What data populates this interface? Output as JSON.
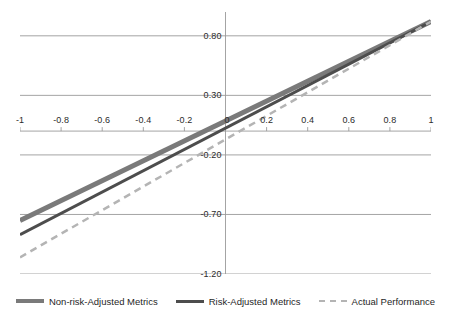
{
  "chart_data": {
    "type": "line",
    "title": "",
    "subtitle": "",
    "xlabel": "",
    "ylabel": "",
    "xlim": [
      -1,
      1
    ],
    "ylim": [
      -1.2,
      1.0
    ],
    "grid": true,
    "legend_position": "bottom",
    "x_ticks": [
      "-1",
      "-0.8",
      "-0.6",
      "-0.4",
      "-0.2",
      "0",
      "0.2",
      "0.4",
      "0.6",
      "0.8",
      "1"
    ],
    "x_tick_values": [
      -1,
      -0.8,
      -0.6,
      -0.4,
      -0.2,
      0,
      0.2,
      0.4,
      0.6,
      0.8,
      1
    ],
    "y_ticks": [
      "0.80",
      "0.30",
      "-0.20",
      "-0.70",
      "-1.20"
    ],
    "y_tick_values": [
      0.8,
      0.3,
      -0.2,
      -0.7,
      -1.2
    ],
    "x": [
      -1,
      1
    ],
    "series": [
      {
        "name": "Non-risk-Adjusted Metrics",
        "color": "#7a7a7a",
        "style": "solid",
        "width": 5,
        "values": [
          -0.75,
          0.92
        ]
      },
      {
        "name": "Risk-Adjusted Metrics",
        "color": "#4d4d4d",
        "style": "solid",
        "width": 3,
        "values": [
          -0.87,
          0.92
        ]
      },
      {
        "name": "Actual Performance",
        "color": "#b4b4b4",
        "style": "dashed",
        "width": 2.5,
        "values": [
          -1.06,
          0.92
        ]
      }
    ]
  },
  "axis": {
    "y_tick_labels": [
      "0.80",
      "0.30",
      "-0.20",
      "-0.70",
      "-1.20"
    ],
    "x_tick_labels": [
      "-1",
      "-0.8",
      "-0.6",
      "-0.4",
      "-0.2",
      "0",
      "0.2",
      "0.4",
      "0.6",
      "0.8",
      "1"
    ]
  },
  "legend": {
    "items": [
      {
        "label": "Non-risk-Adjusted Metrics",
        "swatch": "solid-thick"
      },
      {
        "label": "Risk-Adjusted Metrics",
        "swatch": "solid-thin"
      },
      {
        "label": "Actual Performance",
        "swatch": "dashed"
      }
    ]
  },
  "colors": {
    "grid": "#9a9a9a",
    "axis": "#9a9a9a",
    "text": "#222222",
    "series_non_risk": "#7a7a7a",
    "series_risk": "#4d4d4d",
    "series_actual": "#b4b4b4"
  }
}
